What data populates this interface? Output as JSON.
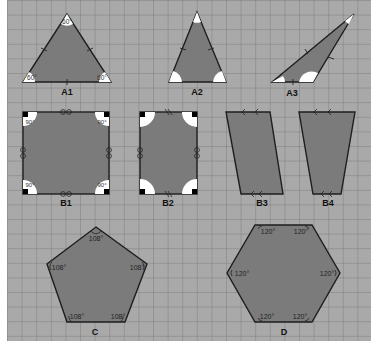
{
  "colors": {
    "background": "#ffffff",
    "grid_fill": "#a9a9a9",
    "grid_minor": "#8e8e8e",
    "grid_major": "#5e5e5e",
    "shape_fill": "#7b7b7b",
    "outline": "#1e1e1e",
    "angle_fill": "#ffffff",
    "right_angle_mark": "#000000",
    "label": "#111111"
  },
  "shapes": [
    {
      "id": "A1",
      "label": "A1",
      "type": "equilateral-triangle",
      "angles": [
        "60°",
        "60°",
        "60°"
      ]
    },
    {
      "id": "A2",
      "label": "A2",
      "type": "isosceles-triangle",
      "angles": []
    },
    {
      "id": "A3",
      "label": "A3",
      "type": "scalene-triangle",
      "angles": []
    },
    {
      "id": "B1",
      "label": "B1",
      "type": "square",
      "angles": [
        "90°",
        "90°",
        "90°",
        "90°"
      ]
    },
    {
      "id": "B2",
      "label": "B2",
      "type": "rectangle",
      "angles": []
    },
    {
      "id": "B3",
      "label": "B3",
      "type": "parallelogram",
      "angles": []
    },
    {
      "id": "B4",
      "label": "B4",
      "type": "trapezoid",
      "angles": []
    },
    {
      "id": "C",
      "label": "C",
      "type": "regular-pentagon",
      "angles": [
        "108°",
        "108°",
        "108°",
        "108°",
        "108°"
      ]
    },
    {
      "id": "D",
      "label": "D",
      "type": "regular-hexagon",
      "angles": [
        "120°",
        "120°",
        "120°",
        "120°",
        "120°",
        "120°"
      ]
    }
  ]
}
